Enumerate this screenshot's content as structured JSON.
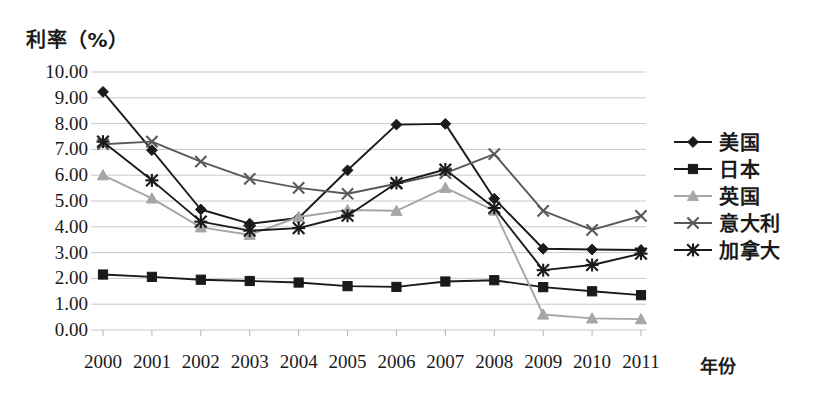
{
  "chart_data": {
    "type": "line",
    "title": "",
    "subtitle": "",
    "ylabel": "利率（%）",
    "xlabel": "年份",
    "grid": true,
    "legend_position": "right",
    "ylim": [
      0,
      10
    ],
    "ytick_step": 1,
    "ytick_labels": [
      "10.00",
      "9.00",
      "8.00",
      "7.00",
      "6.00",
      "5.00",
      "4.00",
      "3.00",
      "2.00",
      "1.00",
      "0.00"
    ],
    "categories": [
      "2000",
      "2001",
      "2002",
      "2003",
      "2004",
      "2005",
      "2006",
      "2007",
      "2008",
      "2009",
      "2010",
      "2011"
    ],
    "series": [
      {
        "name": "美国",
        "marker": "diamond",
        "color": "#1a1a1a",
        "values": [
          9.23,
          6.97,
          4.67,
          4.12,
          4.34,
          6.19,
          7.96,
          7.99,
          5.09,
          3.15,
          3.12,
          3.1
        ]
      },
      {
        "name": "日本",
        "marker": "square",
        "color": "#1a1a1a",
        "values": [
          2.15,
          2.06,
          1.95,
          1.9,
          1.84,
          1.7,
          1.67,
          1.88,
          1.93,
          1.66,
          1.5,
          1.35
        ]
      },
      {
        "name": "英国",
        "marker": "triangle",
        "color": "#a6a6a6",
        "values": [
          6.0,
          5.1,
          3.98,
          3.69,
          4.38,
          4.65,
          4.62,
          5.51,
          4.63,
          0.6,
          0.45,
          0.42
        ]
      },
      {
        "name": "意大利",
        "marker": "cross",
        "color": "#595959",
        "values": [
          7.2,
          7.3,
          6.53,
          5.86,
          5.51,
          5.28,
          5.67,
          6.08,
          6.82,
          4.62,
          3.88,
          4.42
        ]
      },
      {
        "name": "加拿大",
        "marker": "asterisk",
        "color": "#1a1a1a",
        "values": [
          7.3,
          5.8,
          4.2,
          3.85,
          3.95,
          4.43,
          5.7,
          6.22,
          4.73,
          2.32,
          2.52,
          2.96
        ]
      }
    ]
  }
}
